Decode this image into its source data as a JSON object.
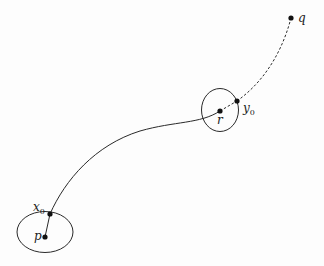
{
  "diagram": {
    "colors": {
      "stroke": "#2a2a2a",
      "point": "#111111",
      "background": "#fdfdfd"
    },
    "points": [
      {
        "id": "p",
        "label": "p",
        "subscript": ""
      },
      {
        "id": "x0",
        "label": "x",
        "subscript": "0"
      },
      {
        "id": "r",
        "label": "r",
        "subscript": ""
      },
      {
        "id": "y0",
        "label": "y",
        "subscript": "0"
      },
      {
        "id": "q",
        "label": "q",
        "subscript": ""
      }
    ],
    "regions": [
      {
        "id": "neighborhood-p",
        "around": "p",
        "shape": "ellipse"
      },
      {
        "id": "neighborhood-r",
        "around": "r",
        "shape": "ellipse"
      }
    ],
    "paths": [
      {
        "id": "segment-p-x0",
        "from": "p",
        "to": "x0",
        "style": "solid"
      },
      {
        "id": "curve-x0-r",
        "from": "x0",
        "to": "r",
        "style": "solid"
      },
      {
        "id": "segment-r-y0",
        "from": "r",
        "to": "y0",
        "style": "dashed"
      },
      {
        "id": "curve-y0-q",
        "from": "y0",
        "to": "q",
        "style": "dashed"
      }
    ],
    "labels": {
      "p": "p",
      "x0_main": "x",
      "x0_sub": "0",
      "r": "r",
      "y0_main": "y",
      "y0_sub": "0",
      "q": "q"
    }
  }
}
